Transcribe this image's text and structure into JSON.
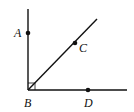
{
  "diagram": {
    "colors": {
      "line": "#111111",
      "background": "#ffffff"
    },
    "vertex": {
      "label": "B",
      "x": 28,
      "y": 90
    },
    "rays": [
      {
        "name": "BA",
        "to": {
          "x": 28,
          "y": 9
        }
      },
      {
        "name": "BD",
        "to": {
          "x": 127,
          "y": 90
        }
      },
      {
        "name": "BC",
        "to": {
          "x": 97,
          "y": 19
        }
      }
    ],
    "points": [
      {
        "label": "A",
        "x": 28,
        "y": 33,
        "lx": 14,
        "ly": 37
      },
      {
        "label": "C",
        "x": 75,
        "y": 43,
        "lx": 79,
        "ly": 52
      },
      {
        "label": "D",
        "x": 88,
        "y": 90,
        "lx": 84,
        "ly": 107
      }
    ],
    "vertex_label": {
      "label": "B",
      "lx": 24,
      "ly": 107
    },
    "right_angle_marker": true
  }
}
